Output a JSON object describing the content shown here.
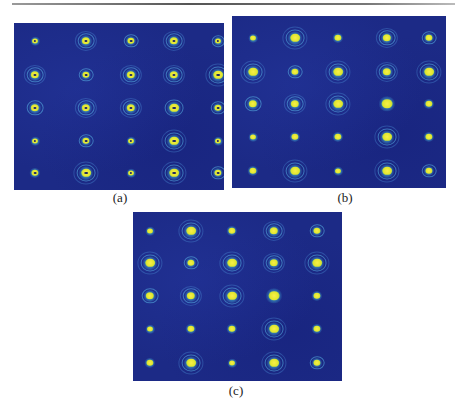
{
  "figure": {
    "panels": [
      {
        "id": "a",
        "label": "(a)",
        "box": {
          "x": 14,
          "y": 23,
          "w": 210,
          "h": 167
        },
        "label_pos": {
          "x": 120,
          "y": 190
        },
        "dark_core": true,
        "cols": [
          21,
          72,
          117,
          160,
          204
        ],
        "rows": [
          18,
          52,
          85,
          118,
          150
        ],
        "spots": [
          [
            {
              "s": 5,
              "r": 0
            },
            {
              "s": 7,
              "r": 2
            },
            {
              "s": 6,
              "r": 1
            },
            {
              "s": 7,
              "r": 2
            },
            {
              "s": 5,
              "r": 1
            }
          ],
          [
            {
              "s": 7,
              "r": 2
            },
            {
              "s": 6,
              "r": 1
            },
            {
              "s": 7,
              "r": 2
            },
            {
              "s": 7,
              "r": 2
            },
            {
              "s": 8,
              "r": 2
            }
          ],
          [
            {
              "s": 7,
              "r": 1
            },
            {
              "s": 7,
              "r": 2
            },
            {
              "s": 7,
              "r": 2
            },
            {
              "s": 8,
              "r": 1
            },
            {
              "s": 6,
              "r": 1
            }
          ],
          [
            {
              "s": 5,
              "r": 0
            },
            {
              "s": 6,
              "r": 1
            },
            {
              "s": 5,
              "r": 0
            },
            {
              "s": 8,
              "r": 2
            },
            {
              "s": 5,
              "r": 0
            }
          ],
          [
            {
              "s": 6,
              "r": 0
            },
            {
              "s": 8,
              "r": 2
            },
            {
              "s": 5,
              "r": 0
            },
            {
              "s": 8,
              "r": 2
            },
            {
              "s": 6,
              "r": 1
            }
          ]
        ]
      },
      {
        "id": "b",
        "label": "(b)",
        "box": {
          "x": 232,
          "y": 16,
          "w": 214,
          "h": 172
        },
        "label_pos": {
          "x": 345,
          "y": 190
        },
        "dark_core": false,
        "cols": [
          21,
          63,
          106,
          155,
          197
        ],
        "rows": [
          22,
          56,
          88,
          121,
          155
        ],
        "spots": [
          [
            {
              "s": 5,
              "r": 0
            },
            {
              "s": 8,
              "r": 2
            },
            {
              "s": 6,
              "r": 0
            },
            {
              "s": 7,
              "r": 2
            },
            {
              "s": 6,
              "r": 1
            }
          ],
          [
            {
              "s": 8,
              "r": 2
            },
            {
              "s": 6,
              "r": 1
            },
            {
              "s": 8,
              "r": 2
            },
            {
              "s": 7,
              "r": 2
            },
            {
              "s": 8,
              "r": 2
            }
          ],
          [
            {
              "s": 7,
              "r": 1
            },
            {
              "s": 7,
              "r": 2
            },
            {
              "s": 8,
              "r": 2
            },
            {
              "s": 9,
              "r": 0
            },
            {
              "s": 6,
              "r": 0
            }
          ],
          [
            {
              "s": 5,
              "r": 0
            },
            {
              "s": 6,
              "r": 0
            },
            {
              "s": 6,
              "r": 0
            },
            {
              "s": 8,
              "r": 2
            },
            {
              "s": 6,
              "r": 0
            }
          ],
          [
            {
              "s": 6,
              "r": 0
            },
            {
              "s": 8,
              "r": 2
            },
            {
              "s": 5,
              "r": 0
            },
            {
              "s": 8,
              "r": 2
            },
            {
              "s": 6,
              "r": 1
            }
          ]
        ]
      },
      {
        "id": "c",
        "label": "(c)",
        "box": {
          "x": 133,
          "y": 212,
          "w": 209,
          "h": 169
        },
        "label_pos": {
          "x": 236,
          "y": 383
        },
        "dark_core": false,
        "cols": [
          17,
          58,
          99,
          141,
          184
        ],
        "rows": [
          19,
          51,
          84,
          117,
          151
        ],
        "spots": [
          [
            {
              "s": 5,
              "r": 0
            },
            {
              "s": 8,
              "r": 2
            },
            {
              "s": 6,
              "r": 0
            },
            {
              "s": 7,
              "r": 2
            },
            {
              "s": 6,
              "r": 1
            }
          ],
          [
            {
              "s": 8,
              "r": 2
            },
            {
              "s": 6,
              "r": 1
            },
            {
              "s": 8,
              "r": 2
            },
            {
              "s": 7,
              "r": 2
            },
            {
              "s": 8,
              "r": 2
            }
          ],
          [
            {
              "s": 7,
              "r": 1
            },
            {
              "s": 7,
              "r": 2
            },
            {
              "s": 8,
              "r": 2
            },
            {
              "s": 9,
              "r": 0
            },
            {
              "s": 6,
              "r": 0
            }
          ],
          [
            {
              "s": 5,
              "r": 0
            },
            {
              "s": 6,
              "r": 0
            },
            {
              "s": 6,
              "r": 0
            },
            {
              "s": 8,
              "r": 2
            },
            {
              "s": 6,
              "r": 0
            }
          ],
          [
            {
              "s": 6,
              "r": 0
            },
            {
              "s": 8,
              "r": 2
            },
            {
              "s": 5,
              "r": 0
            },
            {
              "s": 8,
              "r": 2
            },
            {
              "s": 6,
              "r": 1
            }
          ]
        ]
      }
    ]
  },
  "colors": {
    "background": "#1c2a86",
    "spot_core": "#f6f04a",
    "spot_halo": "#46c8aa",
    "ring": "#5ab4e6"
  }
}
